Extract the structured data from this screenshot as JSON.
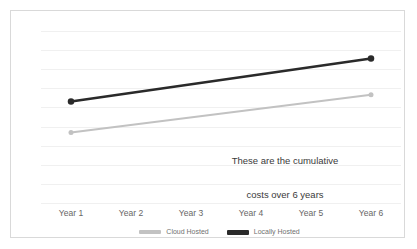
{
  "chart_data": {
    "type": "line",
    "title": "",
    "xlabel": "",
    "ylabel": "",
    "categories": [
      "Year 1",
      "Year 2",
      "Year 3",
      "Year 4",
      "Year 5",
      "Year 6"
    ],
    "ylim": [
      0,
      10
    ],
    "grid": true,
    "gridline_count": 10,
    "legend_position": "bottom-center",
    "annotation": "These are the cumulative\ncosts over 6 years",
    "series": [
      {
        "name": "Cloud Hosted",
        "color": "#c2c2c2",
        "line_width": 2,
        "marker": "circle",
        "x": [
          "Year 1",
          "Year 6"
        ],
        "values": [
          4.1,
          6.3
        ]
      },
      {
        "name": "Locally Hosted",
        "color": "#2a2a2a",
        "line_width": 2.6,
        "marker": "circle",
        "x": [
          "Year 1",
          "Year 6"
        ],
        "values": [
          5.9,
          8.4
        ]
      }
    ]
  },
  "frame": {
    "border_color": "#d9d9d9",
    "background": "#ffffff"
  },
  "gridline_color": "#f0f0f0",
  "axis": {
    "ticks": [
      "Year 1",
      "Year 2",
      "Year 3",
      "Year 4",
      "Year 5",
      "Year 6"
    ],
    "tick_color": "#666666"
  },
  "legend": {
    "items": [
      {
        "label": "Cloud Hosted",
        "color": "#c2c2c2",
        "thickness": 4
      },
      {
        "label": "Locally Hosted",
        "color": "#2a2a2a",
        "thickness": 5
      }
    ]
  },
  "annotation": {
    "line1": "These are the cumulative",
    "line2": "costs over 6 years",
    "color": "#3a3a3a"
  }
}
